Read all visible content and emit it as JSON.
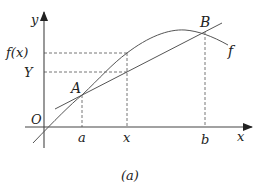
{
  "figure": {
    "caption": "(a)",
    "colors": {
      "stroke": "#444444",
      "dashed": "#666666",
      "text": "#222222",
      "background": "#ffffff"
    }
  },
  "axes": {
    "x_label": "x",
    "y_label": "y",
    "origin_label": "O"
  },
  "x_ticks": [
    {
      "label": "a",
      "px": 82
    },
    {
      "label": "x",
      "px": 127
    },
    {
      "label": "b",
      "px": 205
    }
  ],
  "y_ticks": [
    {
      "label": "f(x)",
      "py": 53
    },
    {
      "label": "Y",
      "py": 72
    }
  ],
  "points": [
    {
      "label": "A",
      "px": 82,
      "py": 95
    },
    {
      "label": "B",
      "px": 205,
      "py": 32
    }
  ],
  "curve": {
    "label": "f"
  }
}
